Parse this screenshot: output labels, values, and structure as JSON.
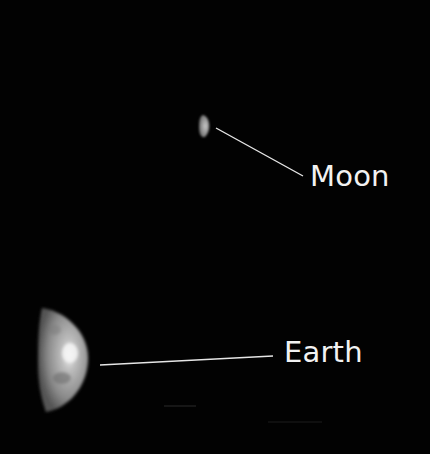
{
  "image": {
    "background": "#020202",
    "subject": "Earth and Moon crescents against black space"
  },
  "bodies": {
    "moon": {
      "label": "Moon",
      "cx": 204,
      "cy": 126,
      "phase": "thin crescent"
    },
    "earth": {
      "label": "Earth",
      "cx": 62,
      "cy": 360,
      "phase": "crescent"
    }
  },
  "labels": {
    "moon": "Moon",
    "earth": "Earth"
  },
  "colors": {
    "label_text": "#f2f2f2",
    "leader_line": "#e6e6e6"
  }
}
